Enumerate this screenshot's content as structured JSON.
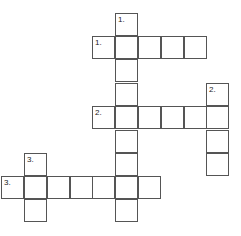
{
  "puzzle": {
    "cell_size": 23,
    "cells": [
      {
        "x": 115,
        "y": 13,
        "num": "1."
      },
      {
        "x": 92,
        "y": 36,
        "num": "1."
      },
      {
        "x": 115,
        "y": 36
      },
      {
        "x": 138,
        "y": 36
      },
      {
        "x": 161,
        "y": 36
      },
      {
        "x": 184,
        "y": 36
      },
      {
        "x": 115,
        "y": 59
      },
      {
        "x": 206,
        "y": 83,
        "num": "2."
      },
      {
        "x": 115,
        "y": 83
      },
      {
        "x": 92,
        "y": 106,
        "num": "2."
      },
      {
        "x": 115,
        "y": 106
      },
      {
        "x": 138,
        "y": 106
      },
      {
        "x": 161,
        "y": 106
      },
      {
        "x": 184,
        "y": 106
      },
      {
        "x": 206,
        "y": 106
      },
      {
        "x": 115,
        "y": 130
      },
      {
        "x": 206,
        "y": 130
      },
      {
        "x": 24,
        "y": 153,
        "num": "3."
      },
      {
        "x": 115,
        "y": 153
      },
      {
        "x": 206,
        "y": 153
      },
      {
        "x": 1,
        "y": 176,
        "num": "3."
      },
      {
        "x": 24,
        "y": 176
      },
      {
        "x": 47,
        "y": 176
      },
      {
        "x": 70,
        "y": 176
      },
      {
        "x": 92,
        "y": 176
      },
      {
        "x": 115,
        "y": 176
      },
      {
        "x": 138,
        "y": 176
      },
      {
        "x": 24,
        "y": 199
      },
      {
        "x": 115,
        "y": 199
      }
    ]
  }
}
